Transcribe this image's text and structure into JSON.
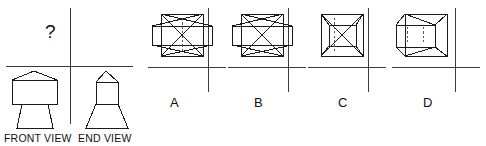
{
  "puzzle": {
    "type": "orthographic-projection-multiple-choice",
    "question_mark": "?",
    "given_views": [
      {
        "id": "front",
        "label": "FRONT VIEW"
      },
      {
        "id": "end",
        "label": "END VIEW"
      }
    ],
    "options": [
      {
        "id": "a",
        "label": "A"
      },
      {
        "id": "b",
        "label": "B"
      },
      {
        "id": "c",
        "label": "C"
      },
      {
        "id": "d",
        "label": "D"
      }
    ]
  },
  "style": {
    "line_color": "#1a1a1a",
    "axis_color": "#3a3a3a",
    "background": "#ffffff",
    "stroke_width": 1,
    "dash_pattern": "2.2,2.2"
  },
  "geometry": {
    "front_view": {
      "description": "rectangle with gabled triangular top over a downward-flaring trapezoid",
      "roof_apex": [
        34,
        71
      ],
      "rect": {
        "x": 12,
        "y": 80,
        "w": 45,
        "h": 24
      },
      "trapezoid_bottom": {
        "x1": 17,
        "x2": 53,
        "y": 128
      }
    },
    "end_view": {
      "description": "narrow rectangle with triangular top over a downward-flaring trapezoid",
      "roof_apex": [
        106,
        71
      ],
      "rect": {
        "x": 96,
        "y": 82,
        "w": 22,
        "h": 22
      },
      "trapezoid_bottom": {
        "x1": 86,
        "x2": 128,
        "y": 128
      }
    },
    "option_a": {
      "description": "outer square, inner rectangle overhanging left and right, X diagonals, dashed vertical centre line",
      "square": {
        "x": 161,
        "y": 14,
        "w": 42,
        "h": 42
      },
      "inner_rect": {
        "x": 152,
        "y": 26,
        "w": 60,
        "h": 19
      },
      "has_x_diagonals": true,
      "dashed_lines": 1
    },
    "option_b": {
      "description": "outer square, inner rectangle overhanging left and right, X diagonals, no hidden dashed lines",
      "square": {
        "x": 241,
        "y": 14,
        "w": 42,
        "h": 42
      },
      "inner_rect": {
        "x": 232,
        "y": 26,
        "w": 60,
        "h": 19
      },
      "has_x_diagonals": true,
      "dashed_lines": 0
    },
    "option_c": {
      "description": "outer square, inner rectangle fully contained, X diagonals, one dashed vertical line left of centre",
      "square": {
        "x": 321,
        "y": 14,
        "w": 42,
        "h": 42
      },
      "inner_rect": {
        "x": 329,
        "y": 25,
        "w": 27,
        "h": 21
      },
      "has_x_diagonals": true,
      "dashed_lines": 1
    },
    "option_d": {
      "description": "outer square, inner rectangle overhanging left, trapezoidal connectors, two dashed vertical lines, no X",
      "square": {
        "x": 405,
        "y": 14,
        "w": 42,
        "h": 42
      },
      "inner_rect": {
        "x": 396,
        "y": 25,
        "w": 39,
        "h": 22
      },
      "has_x_diagonals": false,
      "dashed_lines": 2
    }
  }
}
